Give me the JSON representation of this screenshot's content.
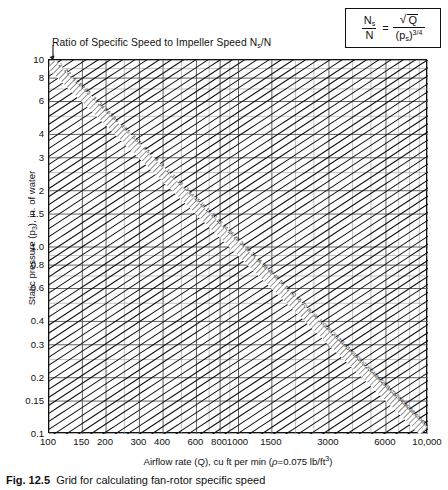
{
  "figure": {
    "diagonal_family_title": "Ratio of Specific Speed to Impeller Speed N",
    "diagonal_family_title_sub": "s",
    "diagonal_family_title_tail": "/N",
    "caption_label": "Fig. 12.5",
    "caption_text": "Grid for calculating fan-rotor specific speed"
  },
  "formula": {
    "num_left": "N",
    "num_left_sub": "s",
    "den_left": "N",
    "equals": "=",
    "num_right": "Q",
    "sqrt_symbol": "√",
    "den_right_open": "(p",
    "den_right_sub": "s",
    "den_right_close": ")",
    "den_right_exp": "3/4"
  },
  "axes": {
    "y": {
      "title": "Static pressure (p",
      "title_sub": "3",
      "title_tail": "), in. of water",
      "min": 0.1,
      "max": 10,
      "scale": "log",
      "ticks": [
        {
          "v": 10,
          "label": "10"
        },
        {
          "v": 8,
          "label": "8"
        },
        {
          "v": 6,
          "label": "6"
        },
        {
          "v": 4,
          "label": "4"
        },
        {
          "v": 3,
          "label": "3"
        },
        {
          "v": 2,
          "label": "2"
        },
        {
          "v": 1.5,
          "label": "1.5"
        },
        {
          "v": 1.0,
          "label": "1.0"
        },
        {
          "v": 0.8,
          "label": "0.8"
        },
        {
          "v": 0.6,
          "label": "0.6"
        },
        {
          "v": 0.4,
          "label": "0.4"
        },
        {
          "v": 0.3,
          "label": "0.3"
        },
        {
          "v": 0.2,
          "label": "0.2"
        },
        {
          "v": 0.15,
          "label": "0.15"
        },
        {
          "v": 0.1,
          "label": "0.1"
        }
      ],
      "gridlines": [
        0.1,
        0.15,
        0.2,
        0.25,
        0.3,
        0.4,
        0.5,
        0.6,
        0.7,
        0.8,
        0.9,
        1.0,
        1.5,
        2,
        2.5,
        3,
        4,
        5,
        6,
        7,
        8,
        9,
        10
      ]
    },
    "x": {
      "title": "Airflow rate (Q), cu ft per min (",
      "title_rho": "ρ",
      "title_tail": "=0.075 lb/ft",
      "title_exp": "3",
      "title_close": ")",
      "min": 100,
      "max": 10000,
      "scale": "log",
      "ticks": [
        {
          "v": 100,
          "label": "100"
        },
        {
          "v": 150,
          "label": "150"
        },
        {
          "v": 200,
          "label": "200"
        },
        {
          "v": 300,
          "label": "300"
        },
        {
          "v": 400,
          "label": "400"
        },
        {
          "v": 600,
          "label": "600"
        },
        {
          "v": 800,
          "label": "800"
        },
        {
          "v": 1000,
          "label": "1000"
        },
        {
          "v": 1500,
          "label": "1500"
        },
        {
          "v": 3000,
          "label": "3000"
        },
        {
          "v": 6000,
          "label": "6000"
        },
        {
          "v": 10000,
          "label": "10,000"
        }
      ],
      "gridlines": [
        100,
        150,
        200,
        250,
        300,
        400,
        500,
        600,
        700,
        800,
        900,
        1000,
        1500,
        2000,
        2500,
        3000,
        4000,
        5000,
        6000,
        7000,
        8000,
        9000,
        10000
      ]
    }
  },
  "chart_data": {
    "type": "line",
    "title": "Grid for calculating fan-rotor specific speed",
    "xlabel": "Airflow rate (Q), cu ft per min (rho=0.075 lb/ft^3)",
    "ylabel": "Static pressure (p3), in. of water",
    "xscale": "log",
    "yscale": "log",
    "xlim": [
      100,
      10000
    ],
    "ylim": [
      0.1,
      10
    ],
    "grid": true,
    "legend": "none",
    "relation": "Ns/N = sqrt(Q) / (ps)^(3/4)",
    "series_description": "Family of straight diagonal lines of constant Ns/N plotted on log-log axes; each line satisfies ps = (sqrt(Q)/(Ns/N))^(4/3).",
    "labeled_contours": [
      2.0,
      2.2,
      2.4,
      2.6,
      2.8,
      3.0,
      3.2,
      3.4,
      3.6,
      3.8,
      4.0,
      4.5,
      5.0,
      5.5,
      6.0,
      6.5,
      7.0,
      8,
      9,
      10,
      11,
      12,
      13,
      14,
      15,
      16,
      18,
      20,
      22,
      24,
      26,
      28,
      30,
      32,
      34,
      36,
      38,
      40,
      45,
      50,
      55,
      60,
      65,
      70,
      80,
      90,
      100,
      110,
      120,
      130,
      140,
      160,
      180,
      200,
      220,
      240,
      260,
      280,
      300,
      320,
      340,
      360,
      380,
      400,
      450,
      500
    ],
    "contour_label_path": "dashed band running from upper-left to lower-right across the grid",
    "annotations": [
      "Ratio of Specific Speed to Impeller Speed Ns/N"
    ]
  }
}
